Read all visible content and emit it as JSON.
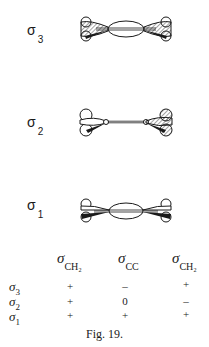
{
  "figure": {
    "caption": "Fig. 19.",
    "orbitals": [
      {
        "symbol": "σ",
        "index": "3",
        "description": "sigma-3 molecular orbital drawing with hatched CH2 lobes, central CC ellipse"
      },
      {
        "symbol": "σ",
        "index": "2",
        "description": "sigma-2 molecular orbital drawing with node at CC bond, left open lobes, right hatched lobes"
      },
      {
        "symbol": "σ",
        "index": "1",
        "description": "sigma-1 molecular orbital drawing with open CH2 lobes, central CC ellipse"
      }
    ],
    "table": {
      "columns": [
        {
          "symbol": "σ",
          "sub": "CH₂"
        },
        {
          "symbol": "σ",
          "sub": "CC"
        },
        {
          "symbol": "σ",
          "sub": "CH₂"
        }
      ],
      "rows": [
        {
          "symbol": "σ",
          "sub": "3",
          "values": [
            "+",
            "–",
            "+"
          ]
        },
        {
          "symbol": "σ",
          "sub": "2",
          "values": [
            "+",
            "0",
            "–"
          ]
        },
        {
          "symbol": "σ",
          "sub": "1",
          "values": [
            "+",
            "+",
            "+"
          ]
        }
      ]
    }
  }
}
